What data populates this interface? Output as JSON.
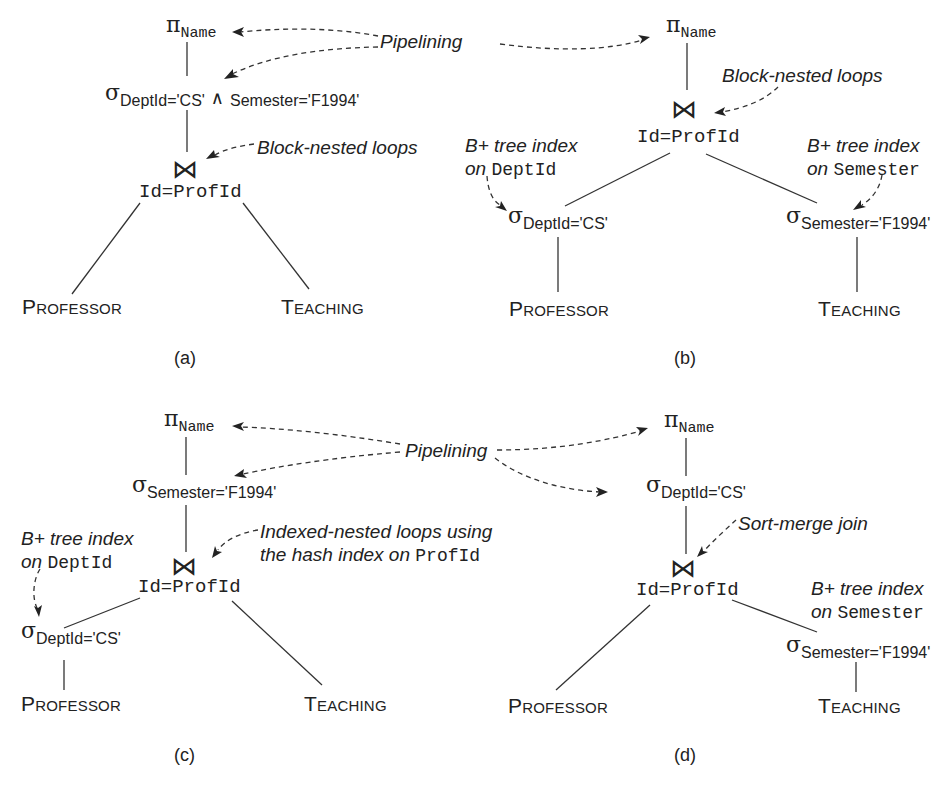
{
  "figure": {
    "panels": [
      {
        "caption": "(a)",
        "projection": {
          "symbol": "π",
          "attr": "Name"
        },
        "selection": {
          "symbol": "σ",
          "cond1": "DeptId='CS'",
          "and": "∧",
          "cond2": "Semester='F1994'"
        },
        "join": {
          "symbol": "⋈",
          "condition": "Id=ProfId"
        },
        "left_relation": {
          "first": "P",
          "rest": "ROFESSOR"
        },
        "right_relation": {
          "first": "T",
          "rest": "EACHING"
        },
        "annotations": {
          "join_method": "Block-nested loops"
        }
      },
      {
        "caption": "(b)",
        "projection": {
          "symbol": "π",
          "attr": "Name"
        },
        "join": {
          "symbol": "⋈",
          "condition": "Id=ProfId"
        },
        "left_selection": {
          "symbol": "σ",
          "cond": "DeptId='CS'"
        },
        "right_selection": {
          "symbol": "σ",
          "cond": "Semester='F1994'"
        },
        "left_relation": {
          "first": "P",
          "rest": "ROFESSOR"
        },
        "right_relation": {
          "first": "T",
          "rest": "EACHING"
        },
        "annotations": {
          "join_method": "Block-nested loops",
          "left_index_line1": "B+ tree index",
          "left_index_on": "on",
          "left_index_attr": "DeptId",
          "right_index_line1": "B+ tree index",
          "right_index_on": "on",
          "right_index_attr": "Semester"
        }
      },
      {
        "caption": "(c)",
        "projection": {
          "symbol": "π",
          "attr": "Name"
        },
        "selection": {
          "symbol": "σ",
          "cond": "Semester='F1994'"
        },
        "join": {
          "symbol": "⋈",
          "condition": "Id=ProfId"
        },
        "left_selection": {
          "symbol": "σ",
          "cond": "DeptId='CS'"
        },
        "left_relation": {
          "first": "P",
          "rest": "ROFESSOR"
        },
        "right_relation": {
          "first": "T",
          "rest": "EACHING"
        },
        "annotations": {
          "join_method_line1": "Indexed-nested loops using",
          "join_method_line2": "the hash index on",
          "join_method_attr": "ProfId",
          "left_index_line1": "B+ tree index",
          "left_index_on": "on",
          "left_index_attr": "DeptId"
        }
      },
      {
        "caption": "(d)",
        "projection": {
          "symbol": "π",
          "attr": "Name"
        },
        "selection": {
          "symbol": "σ",
          "cond": "DeptId='CS'"
        },
        "join": {
          "symbol": "⋈",
          "condition": "Id=ProfId"
        },
        "right_selection": {
          "symbol": "σ",
          "cond": "Semester='F1994'"
        },
        "left_relation": {
          "first": "P",
          "rest": "ROFESSOR"
        },
        "right_relation": {
          "first": "T",
          "rest": "EACHING"
        },
        "annotations": {
          "join_method": "Sort-merge join",
          "right_index_line1": "B+ tree index",
          "right_index_on": "on",
          "right_index_attr": "Semester"
        }
      }
    ],
    "shared_labels": {
      "pipelining_top": "Pipelining",
      "pipelining_bottom": "Pipelining"
    },
    "colors": {
      "ink": "#222222",
      "background": "#ffffff"
    }
  }
}
